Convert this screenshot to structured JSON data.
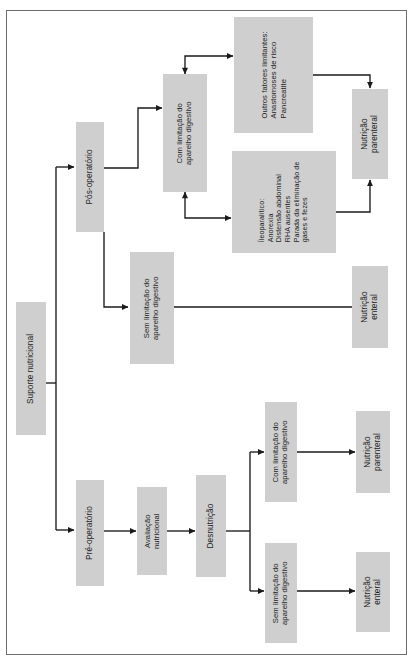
{
  "diagram": {
    "title": "Suporte nutricional",
    "language": "pt-BR",
    "orientation": "rotated-90-ccw",
    "colors": {
      "node_fill": "#cfcfcf",
      "connector": "#1a1a1a",
      "frame": "#6e6e6e",
      "background": "#ffffff"
    },
    "nodes": [
      {
        "id": "suporte-nutricional",
        "label": "Suporte nutricional"
      },
      {
        "id": "pos-operatorio",
        "label": "Pós-operatório"
      },
      {
        "id": "pre-operatorio",
        "label": "Pré-operatório"
      },
      {
        "id": "com-limitacao-pos",
        "label": "Com limitação do\naparelho digestivo"
      },
      {
        "id": "sem-limitacao-pos",
        "label": "Sem limitação do\naparelho digestivo"
      },
      {
        "id": "outros-fatores",
        "label": "Outros fatores limitantes:\nAnastomoses de risco\nPancreatite"
      },
      {
        "id": "ileoparalitico",
        "label": "Íleoparalítico:\nAnorexia\nDistensão abdominal\nRHA ausentes\nParada da eliminação de\ngases e fezes"
      },
      {
        "id": "nutricao-parenteral-pos",
        "label": "Nutrição\nparenteral"
      },
      {
        "id": "nutricao-enteral-pos",
        "label": "Nutrição\nenteral"
      },
      {
        "id": "avaliacao-nutricional",
        "label": "Avaliação\nnutricional"
      },
      {
        "id": "desnutricao",
        "label": "Desnutrição"
      },
      {
        "id": "com-limitacao-pre",
        "label": "Com limitação do\naparelho digestivo"
      },
      {
        "id": "sem-limitacao-pre",
        "label": "Sem limitação do\naparelho digestivo"
      },
      {
        "id": "nutricao-parenteral-pre",
        "label": "Nutrição\nparenteral"
      },
      {
        "id": "nutricao-enteral-pre",
        "label": "Nutrição\nenteral"
      }
    ],
    "edges": [
      {
        "from": "suporte-nutricional",
        "to": "pos-operatorio",
        "arrow": "single"
      },
      {
        "from": "suporte-nutricional",
        "to": "pre-operatorio",
        "arrow": "single"
      },
      {
        "from": "pos-operatorio",
        "to": "com-limitacao-pos",
        "arrow": "single"
      },
      {
        "from": "pos-operatorio",
        "to": "sem-limitacao-pos",
        "arrow": "single"
      },
      {
        "from": "com-limitacao-pos",
        "to": "outros-fatores",
        "arrow": "double"
      },
      {
        "from": "com-limitacao-pos",
        "to": "ileoparalitico",
        "arrow": "double"
      },
      {
        "from": "outros-fatores",
        "to": "nutricao-parenteral-pos",
        "arrow": "single"
      },
      {
        "from": "ileoparalitico",
        "to": "nutricao-parenteral-pos",
        "arrow": "single"
      },
      {
        "from": "sem-limitacao-pos",
        "to": "nutricao-enteral-pos",
        "arrow": "single"
      },
      {
        "from": "pre-operatorio",
        "to": "avaliacao-nutricional",
        "arrow": "single"
      },
      {
        "from": "avaliacao-nutricional",
        "to": "desnutricao",
        "arrow": "single"
      },
      {
        "from": "desnutricao",
        "to": "com-limitacao-pre",
        "arrow": "single"
      },
      {
        "from": "desnutricao",
        "to": "sem-limitacao-pre",
        "arrow": "single"
      },
      {
        "from": "com-limitacao-pre",
        "to": "nutricao-parenteral-pre",
        "arrow": "single"
      },
      {
        "from": "sem-limitacao-pre",
        "to": "nutricao-enteral-pre",
        "arrow": "single"
      }
    ]
  }
}
